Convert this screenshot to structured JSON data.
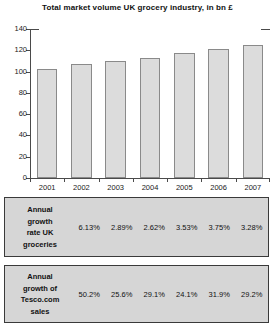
{
  "chart_data": {
    "type": "bar",
    "title": "Total market volume UK grocery industry, in bn £",
    "xlabel": "",
    "ylabel": "",
    "categories": [
      "2001",
      "2002",
      "2003",
      "2004",
      "2005",
      "2006",
      "2007"
    ],
    "values": [
      102,
      107,
      110,
      113,
      117,
      121,
      125
    ],
    "ylim": [
      0,
      140
    ],
    "yticks": [
      0,
      20,
      40,
      60,
      80,
      100,
      120,
      140
    ],
    "ytick_labels": [
      "0",
      "20",
      "40",
      "60",
      "80",
      "100",
      "120",
      "140"
    ],
    "grid": false,
    "legend": "none",
    "bar_fill": "#dcdcdc",
    "bar_border": "#8a8a8a",
    "tables": [
      {
        "label": "Annual growth rate UK groceries",
        "label_lines": [
          "Annual",
          "growth",
          "rate UK",
          "groceries"
        ],
        "categories": [
          "2002",
          "2003",
          "2004",
          "2005",
          "2006",
          "2007"
        ],
        "values": [
          "6.13%",
          "2.89%",
          "2.62%",
          "3.53%",
          "3.75%",
          "3.28%"
        ]
      },
      {
        "label": "Annual growth of Tesco.com sales",
        "label_lines": [
          "Annual",
          "growth of",
          "Tesco.com",
          "sales"
        ],
        "categories": [
          "2002",
          "2003",
          "2004",
          "2005",
          "2006",
          "2007"
        ],
        "values": [
          "50.2%",
          "25.6%",
          "29.1%",
          "24.1%",
          "31.9%",
          "29.2%"
        ]
      }
    ]
  }
}
